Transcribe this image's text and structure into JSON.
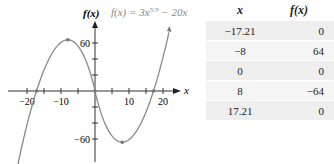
{
  "chart_data": {
    "type": "line",
    "function_label": "f(x) = 3x",
    "function_exponent": "5/3",
    "function_tail": " − 20x",
    "xlabel": "x",
    "ylabel": "f(x)",
    "xlim": [
      -26,
      24
    ],
    "ylim": [
      -90,
      92
    ],
    "x_ticks": [
      -20,
      -15,
      -10,
      -5,
      5,
      10,
      15,
      20
    ],
    "x_tick_labels": {
      "-20": "−20",
      "-10": "−10",
      "10": "10",
      "20": "20"
    },
    "y_ticks": [
      -60,
      -40,
      -20,
      20,
      40,
      60
    ],
    "y_tick_labels": {
      "60": "60",
      "-60": "−60"
    },
    "grid": false,
    "series": [
      {
        "name": "f(x) = 3x^(5/3) − 20x",
        "color": "#888888",
        "points": [
          [
            -26,
            -79
          ],
          [
            -17.21,
            0
          ],
          [
            -8,
            64
          ],
          [
            0,
            0
          ],
          [
            8,
            -64
          ],
          [
            17.21,
            0
          ],
          [
            22,
            92
          ]
        ]
      }
    ],
    "marked_points": [
      [
        -17.21,
        0
      ],
      [
        -8,
        64
      ],
      [
        0,
        0
      ],
      [
        8,
        -64
      ],
      [
        17.21,
        0
      ]
    ]
  },
  "table": {
    "headers": [
      "x",
      "f(x)"
    ],
    "rows": [
      [
        "−17.21",
        "0"
      ],
      [
        "−8",
        "64"
      ],
      [
        "0",
        "0"
      ],
      [
        "8",
        "−64"
      ],
      [
        "17.21",
        "0"
      ]
    ]
  },
  "colors": {
    "curve": "#888888",
    "axis": "#333333",
    "row_shade": "#eeeeee"
  }
}
